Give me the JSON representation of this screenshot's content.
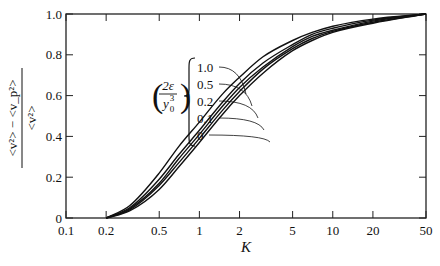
{
  "chart_data": {
    "type": "line",
    "title": "",
    "xlabel": "K",
    "ylabel": "(<v²> − <v_p²>) / <v²>",
    "ylabel_numerator": "<v²> − <v_p²>",
    "ylabel_denominator": "<v²>",
    "xscale": "log",
    "xlim": [
      0.1,
      50
    ],
    "ylim": [
      0,
      1.0
    ],
    "xticks": [
      0.1,
      0.2,
      0.5,
      1,
      2,
      5,
      10,
      20,
      50
    ],
    "xtick_labels": [
      "0.1",
      "0.2",
      "0.5",
      "1",
      "2",
      "5",
      "10",
      "20",
      "50"
    ],
    "yticks": [
      0,
      0.2,
      0.4,
      0.6,
      0.8,
      1.0
    ],
    "ytick_labels": [
      "0",
      "0.2",
      "0.4",
      "0.6",
      "0.8",
      "1.0"
    ],
    "grid": false,
    "legend": {
      "parameter_label": "(2ε / y₀³)",
      "position": "inside upper-left, bracketed annotations with leader lines",
      "entries": [
        "1.0",
        "0.5",
        "0.2",
        "0.1",
        "0"
      ]
    },
    "x": [
      0.2,
      0.3,
      0.5,
      0.7,
      1,
      1.5,
      2,
      3,
      5,
      7,
      10,
      20,
      50
    ],
    "series": [
      {
        "name": "1.0",
        "values": [
          0.0,
          0.06,
          0.22,
          0.35,
          0.47,
          0.61,
          0.69,
          0.79,
          0.87,
          0.91,
          0.94,
          0.975,
          1.0
        ]
      },
      {
        "name": "0.5",
        "values": [
          0.0,
          0.05,
          0.19,
          0.31,
          0.43,
          0.57,
          0.66,
          0.76,
          0.85,
          0.9,
          0.93,
          0.97,
          1.0
        ]
      },
      {
        "name": "0.2",
        "values": [
          0.0,
          0.045,
          0.17,
          0.29,
          0.41,
          0.55,
          0.64,
          0.74,
          0.84,
          0.89,
          0.92,
          0.965,
          1.0
        ]
      },
      {
        "name": "0.1",
        "values": [
          0.0,
          0.04,
          0.16,
          0.27,
          0.39,
          0.53,
          0.62,
          0.73,
          0.83,
          0.88,
          0.915,
          0.96,
          1.0
        ]
      },
      {
        "name": "0",
        "values": [
          0.0,
          0.035,
          0.14,
          0.25,
          0.37,
          0.51,
          0.6,
          0.71,
          0.82,
          0.87,
          0.91,
          0.955,
          1.0
        ]
      }
    ]
  }
}
